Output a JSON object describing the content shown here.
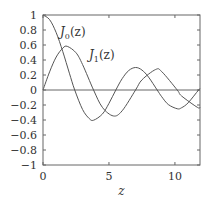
{
  "chart_data": {
    "type": "line",
    "title": "",
    "xlabel": "z",
    "ylabel": "",
    "xlim": [
      0,
      11.9
    ],
    "ylim": [
      -1,
      1
    ],
    "xticks": [
      0,
      5,
      10
    ],
    "xtick_labels": [
      "0",
      "5",
      "10"
    ],
    "yticks": [
      1,
      0.8,
      0.6,
      0.4,
      0.2,
      0,
      -0.2,
      -0.4,
      -0.6,
      -0.8,
      -1
    ],
    "ytick_labels": [
      "1",
      "0.8",
      "0.6",
      "0.4",
      "0.2",
      "0",
      "−0.2",
      "−0.4",
      "−0.6",
      "−0.8",
      "−1"
    ],
    "grid": false,
    "zero_line": true,
    "legend": "inline labels",
    "series": [
      {
        "name": "J0(z)",
        "label_main": "J",
        "label_sub": "0",
        "label_arg": "(z)",
        "color": "#555555",
        "x": [
          0,
          0.5,
          1,
          1.5,
          2,
          2.405,
          3,
          3.5,
          3.832,
          4.5,
          5,
          5.52,
          6,
          6.5,
          7.016,
          7.5,
          8,
          8.654,
          9,
          9.5,
          10.173,
          10.5,
          11,
          11.792,
          11.9
        ],
        "values": [
          1,
          0.938,
          0.765,
          0.512,
          0.224,
          0,
          -0.26,
          -0.38,
          -0.403,
          -0.321,
          -0.178,
          0,
          0.151,
          0.26,
          0.3,
          0.266,
          0.172,
          0,
          -0.09,
          -0.194,
          -0.25,
          -0.237,
          -0.171,
          0,
          0.015
        ]
      },
      {
        "name": "J1(z)",
        "label_main": "J",
        "label_sub": "1",
        "label_arg": "(z)",
        "color": "#555555",
        "x": [
          0,
          0.5,
          1,
          1.5,
          1.841,
          2.5,
          3,
          3.832,
          4.5,
          5.331,
          6,
          7.016,
          7.5,
          8.536,
          9,
          10.173,
          10.5,
          11.706,
          11.9
        ],
        "values": [
          0,
          0.242,
          0.44,
          0.558,
          0.582,
          0.497,
          0.339,
          0,
          -0.231,
          -0.346,
          -0.277,
          0,
          0.135,
          0.273,
          0.245,
          0,
          -0.079,
          -0.232,
          -0.229
        ]
      }
    ]
  }
}
